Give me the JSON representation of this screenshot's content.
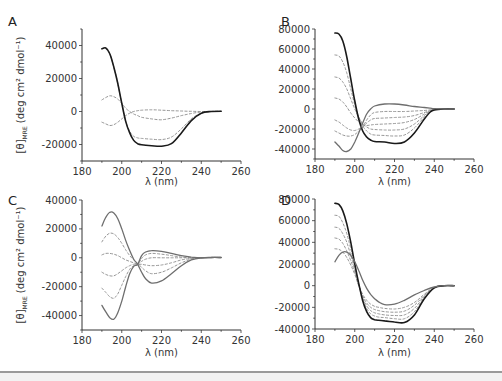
{
  "figure": {
    "panels": [
      "A",
      "B",
      "C",
      "D"
    ],
    "xlabel": "λ (nm)",
    "ylabel_main": "[θ]",
    "ylabel_sub": "MRE",
    "ylabel_units": " (deg cm² dmol⁻¹)"
  },
  "colors": {
    "solid_dark": "#1a1a1a",
    "solid_grey": "#6e6e6e",
    "dashed": "#8a8a8a",
    "axis": "#333333",
    "rule": "#9a9a9a"
  },
  "chart_data": [
    {
      "panel": "A",
      "type": "line",
      "xlabel": "λ (nm)",
      "ylabel": "[θ]MRE (deg cm² dmol⁻¹)",
      "xlim": [
        180,
        260
      ],
      "ylim": [
        -30000,
        50000
      ],
      "xticks": [
        180,
        200,
        220,
        240,
        260
      ],
      "yticks": [
        -20000,
        0,
        20000,
        40000
      ],
      "x": [
        190,
        192,
        194,
        196,
        198,
        200,
        202,
        204,
        206,
        208,
        210,
        215,
        220,
        225,
        230,
        235,
        240,
        245,
        250
      ],
      "series": [
        {
          "name": "solid",
          "style": "solid-dark",
          "values": [
            38000,
            38500,
            35000,
            27000,
            17000,
            5000,
            -6000,
            -13000,
            -17500,
            -19500,
            -20200,
            -20800,
            -21000,
            -19500,
            -13000,
            -5500,
            -1000,
            0,
            200
          ]
        },
        {
          "name": "dashed-1",
          "style": "dashed",
          "values": [
            7000,
            8500,
            9500,
            9000,
            7500,
            5000,
            2000,
            0,
            -1500,
            -2500,
            -3500,
            -4500,
            -5000,
            -4000,
            -2500,
            -1200,
            -300,
            0,
            0
          ]
        },
        {
          "name": "dashed-2",
          "style": "dashed",
          "values": [
            -6500,
            -7500,
            -8500,
            -8000,
            -6500,
            -4500,
            -2500,
            -1000,
            0,
            500,
            800,
            1000,
            800,
            500,
            300,
            100,
            0,
            0,
            0
          ]
        },
        {
          "name": "dashed-3",
          "style": "dashed",
          "values": [
            38000,
            38500,
            35000,
            27000,
            17000,
            5000,
            -6000,
            -12000,
            -15000,
            -16000,
            -16300,
            -16800,
            -17000,
            -15500,
            -10500,
            -4500,
            -1000,
            0,
            200
          ]
        }
      ]
    },
    {
      "panel": "B",
      "type": "line",
      "xlabel": "λ (nm)",
      "ylabel": "",
      "xlim": [
        180,
        260
      ],
      "ylim": [
        -50000,
        80000
      ],
      "xticks": [
        180,
        200,
        220,
        240,
        260
      ],
      "yticks": [
        -40000,
        -20000,
        0,
        20000,
        40000,
        60000,
        80000
      ],
      "x": [
        190,
        192,
        194,
        196,
        198,
        200,
        202,
        204,
        206,
        208,
        210,
        215,
        220,
        225,
        230,
        235,
        238,
        240,
        245,
        250
      ],
      "series": [
        {
          "name": "solid-dark",
          "style": "solid-dark",
          "values": [
            76000,
            75000,
            68000,
            52000,
            30000,
            8000,
            -10000,
            -22000,
            -28000,
            -31000,
            -32500,
            -33000,
            -34500,
            -33000,
            -24000,
            -10000,
            -3000,
            -1000,
            0,
            0
          ]
        },
        {
          "name": "dashed-1",
          "style": "dashed",
          "values": [
            54000,
            53000,
            47000,
            36000,
            20000,
            4000,
            -8000,
            -17000,
            -22000,
            -25000,
            -26000,
            -26500,
            -27000,
            -26000,
            -19000,
            -8000,
            -2500,
            -800,
            0,
            0
          ]
        },
        {
          "name": "dashed-2",
          "style": "dashed",
          "values": [
            32000,
            31000,
            27000,
            20000,
            10000,
            0,
            -8000,
            -15000,
            -18000,
            -20000,
            -20500,
            -21000,
            -21000,
            -20000,
            -15000,
            -6500,
            -2000,
            -600,
            0,
            0
          ]
        },
        {
          "name": "dashed-3",
          "style": "dashed",
          "values": [
            11000,
            10000,
            7000,
            2000,
            -4000,
            -9000,
            -13000,
            -16000,
            -16500,
            -16000,
            -15500,
            -15000,
            -14500,
            -13500,
            -10500,
            -5000,
            -1800,
            -500,
            0,
            0
          ]
        },
        {
          "name": "dashed-4",
          "style": "dashed",
          "values": [
            -11000,
            -13000,
            -16000,
            -19000,
            -21000,
            -21500,
            -20000,
            -18000,
            -14000,
            -11000,
            -9500,
            -9000,
            -8500,
            -8000,
            -6500,
            -3500,
            -1500,
            -400,
            0,
            0
          ]
        },
        {
          "name": "dashed-5",
          "style": "dashed",
          "values": [
            -22000,
            -24000,
            -26000,
            -27000,
            -27000,
            -25500,
            -22000,
            -18000,
            -11000,
            -6000,
            -3500,
            -2500,
            -2500,
            -2500,
            -2000,
            -1500,
            -800,
            -300,
            0,
            0
          ]
        },
        {
          "name": "solid-grey",
          "style": "solid-grey",
          "values": [
            -33000,
            -37000,
            -41500,
            -42500,
            -40000,
            -33000,
            -24000,
            -14000,
            -5000,
            0,
            3000,
            5000,
            5000,
            4000,
            2500,
            1500,
            800,
            300,
            0,
            0
          ]
        }
      ]
    },
    {
      "panel": "C",
      "type": "line",
      "xlabel": "λ (nm)",
      "ylabel": "[θ]MRE (deg cm² dmol⁻¹)",
      "xlim": [
        180,
        260
      ],
      "ylim": [
        -50000,
        40000
      ],
      "xticks": [
        180,
        200,
        220,
        240,
        260
      ],
      "yticks": [
        -40000,
        -20000,
        0,
        20000,
        40000
      ],
      "x": [
        190,
        192,
        194,
        196,
        198,
        200,
        202,
        204,
        206,
        208,
        210,
        212,
        215,
        220,
        225,
        230,
        235,
        240,
        245,
        250
      ],
      "series": [
        {
          "name": "solid-top",
          "style": "solid-grey",
          "values": [
            22000,
            28000,
            31500,
            31000,
            27000,
            20000,
            12000,
            5000,
            -1000,
            -4500,
            -10000,
            -14500,
            -17500,
            -16000,
            -11000,
            -5500,
            -1500,
            0,
            200,
            200
          ]
        },
        {
          "name": "dashed-1",
          "style": "dashed",
          "values": [
            11000,
            15000,
            17000,
            16500,
            14000,
            10000,
            5500,
            1500,
            -1500,
            -4000,
            -6500,
            -9000,
            -11000,
            -10000,
            -7000,
            -3500,
            -1000,
            0,
            200,
            200
          ]
        },
        {
          "name": "dashed-2",
          "style": "dashed",
          "values": [
            2000,
            3000,
            3000,
            2500,
            1500,
            0,
            -1500,
            -2500,
            -3500,
            -4500,
            -4500,
            -5000,
            -5500,
            -5000,
            -3500,
            -1500,
            -500,
            0,
            200,
            200
          ]
        },
        {
          "name": "dashed-3",
          "style": "dashed",
          "values": [
            -10000,
            -11500,
            -12500,
            -12500,
            -11000,
            -9000,
            -7000,
            -5500,
            -4500,
            -4500,
            -2500,
            -1000,
            0,
            0,
            0,
            0,
            0,
            0,
            200,
            200
          ]
        },
        {
          "name": "dashed-4",
          "style": "dashed",
          "values": [
            -21000,
            -24000,
            -27000,
            -28000,
            -25000,
            -19000,
            -13000,
            -8000,
            -5500,
            -4500,
            -500,
            2000,
            3000,
            2500,
            1500,
            500,
            0,
            0,
            200,
            200
          ]
        },
        {
          "name": "solid-bottom",
          "style": "solid-grey",
          "values": [
            -33000,
            -37500,
            -41500,
            -42500,
            -38000,
            -30000,
            -20000,
            -11000,
            -6000,
            -4500,
            1500,
            4000,
            5000,
            4500,
            3000,
            1500,
            500,
            0,
            200,
            200
          ]
        }
      ]
    },
    {
      "panel": "D",
      "type": "line",
      "xlabel": "λ (nm)",
      "ylabel": "",
      "xlim": [
        180,
        260
      ],
      "ylim": [
        -40000,
        80000
      ],
      "xticks": [
        180,
        200,
        220,
        240,
        260
      ],
      "yticks": [
        -40000,
        -20000,
        0,
        20000,
        40000,
        60000,
        80000
      ],
      "x": [
        190,
        192,
        194,
        196,
        198,
        200,
        202,
        204,
        206,
        208,
        210,
        212,
        215,
        220,
        225,
        230,
        235,
        240,
        245,
        250
      ],
      "series": [
        {
          "name": "solid-dark",
          "style": "solid-dark",
          "values": [
            76000,
            75000,
            69000,
            57000,
            40000,
            20000,
            2000,
            -14000,
            -24000,
            -29500,
            -31500,
            -32000,
            -32500,
            -33500,
            -34000,
            -27000,
            -12000,
            -2000,
            0,
            0
          ]
        },
        {
          "name": "dashed-1",
          "style": "dashed",
          "values": [
            65000,
            64000,
            58000,
            48000,
            34000,
            18000,
            1500,
            -12000,
            -21000,
            -26000,
            -28000,
            -29000,
            -29500,
            -30500,
            -30500,
            -24000,
            -11000,
            -2000,
            0,
            0
          ]
        },
        {
          "name": "dashed-2",
          "style": "dashed",
          "values": [
            54000,
            53000,
            48000,
            40000,
            28000,
            15000,
            1000,
            -11000,
            -18500,
            -23000,
            -25000,
            -26000,
            -27000,
            -27500,
            -27000,
            -21000,
            -10000,
            -1800,
            0,
            0
          ]
        },
        {
          "name": "dashed-3",
          "style": "dashed",
          "values": [
            44000,
            43000,
            39000,
            32000,
            23000,
            12500,
            500,
            -9500,
            -16000,
            -20000,
            -22000,
            -23000,
            -24000,
            -24500,
            -23500,
            -18000,
            -9000,
            -1600,
            0,
            0
          ]
        },
        {
          "name": "dashed-4",
          "style": "dashed",
          "values": [
            34000,
            33500,
            31000,
            26000,
            19000,
            10500,
            0,
            -8000,
            -13500,
            -17000,
            -19000,
            -20000,
            -21000,
            -21500,
            -20000,
            -15500,
            -8000,
            -1400,
            0,
            0
          ]
        },
        {
          "name": "solid-grey",
          "style": "solid-grey",
          "values": [
            22000,
            28000,
            31000,
            31000,
            28000,
            22000,
            14000,
            5000,
            -2500,
            -8000,
            -12000,
            -15000,
            -17500,
            -17000,
            -13500,
            -8500,
            -4500,
            -1200,
            0,
            0
          ]
        }
      ]
    }
  ]
}
